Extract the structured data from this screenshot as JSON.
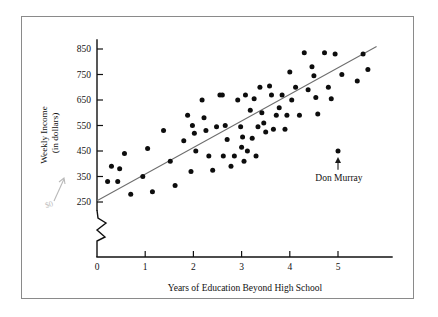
{
  "figure": {
    "background_color": "#ffffff",
    "frame_color": "#8a8a8a",
    "ink_color": "#111111",
    "regression_line_color": "#6e6e6e",
    "pencil_color": "#bdbdbd"
  },
  "chart_data": {
    "type": "scatter",
    "title": "",
    "xlabel": "Years of Education Beyond High School",
    "ylabel": "Weekly Income (in dollars)",
    "ylabel_line1": "Weekly Income",
    "ylabel_line2": "(in dollars)",
    "xlim": [
      0,
      5.85
    ],
    "ylim": [
      250,
      880
    ],
    "xticks": [
      0,
      1,
      2,
      3,
      4,
      5
    ],
    "xtick_labels": [
      "0",
      "1",
      "2",
      "3",
      "4",
      "5"
    ],
    "yticks": [
      250,
      350,
      450,
      550,
      650,
      750,
      850
    ],
    "ytick_labels": [
      "250",
      "350",
      "450",
      "550",
      "650",
      "750",
      "850"
    ],
    "grid": false,
    "legend": "none",
    "y_axis_break": true,
    "y_axis_break_note": "zigzag break between 0 and 250 on the vertical axis",
    "trend_line": {
      "label": "least-squares regression line",
      "x_start": 0.0,
      "y_start": 255,
      "x_end": 5.8,
      "y_end": 860,
      "slope": 104.3,
      "intercept": 255
    },
    "annotations": [
      {
        "text": "Don Murray",
        "points_to_x": 5.0,
        "points_to_y": 450,
        "label_x": 5.02,
        "label_y": 345,
        "arrow": "up"
      },
      {
        "text": "$0",
        "style": "handwritten-pencil",
        "points_to_x": -0.95,
        "points_to_y": 330,
        "arrow": "up"
      }
    ],
    "points": [
      {
        "x": 0.22,
        "y": 330
      },
      {
        "x": 0.3,
        "y": 390
      },
      {
        "x": 0.43,
        "y": 330
      },
      {
        "x": 0.47,
        "y": 380
      },
      {
        "x": 0.57,
        "y": 440
      },
      {
        "x": 0.7,
        "y": 280
      },
      {
        "x": 0.95,
        "y": 350
      },
      {
        "x": 1.05,
        "y": 460
      },
      {
        "x": 1.15,
        "y": 290
      },
      {
        "x": 1.38,
        "y": 530
      },
      {
        "x": 1.52,
        "y": 410
      },
      {
        "x": 1.62,
        "y": 315
      },
      {
        "x": 1.8,
        "y": 490
      },
      {
        "x": 1.88,
        "y": 590
      },
      {
        "x": 1.95,
        "y": 370
      },
      {
        "x": 1.98,
        "y": 550
      },
      {
        "x": 2.02,
        "y": 520
      },
      {
        "x": 2.05,
        "y": 450
      },
      {
        "x": 2.18,
        "y": 650
      },
      {
        "x": 2.22,
        "y": 580
      },
      {
        "x": 2.26,
        "y": 530
      },
      {
        "x": 2.32,
        "y": 430
      },
      {
        "x": 2.4,
        "y": 375
      },
      {
        "x": 2.48,
        "y": 545
      },
      {
        "x": 2.55,
        "y": 670
      },
      {
        "x": 2.6,
        "y": 670
      },
      {
        "x": 2.62,
        "y": 430
      },
      {
        "x": 2.66,
        "y": 550
      },
      {
        "x": 2.7,
        "y": 495
      },
      {
        "x": 2.78,
        "y": 390
      },
      {
        "x": 2.85,
        "y": 430
      },
      {
        "x": 2.92,
        "y": 650
      },
      {
        "x": 2.98,
        "y": 545
      },
      {
        "x": 3.0,
        "y": 465
      },
      {
        "x": 3.02,
        "y": 505
      },
      {
        "x": 3.05,
        "y": 410
      },
      {
        "x": 3.08,
        "y": 670
      },
      {
        "x": 3.12,
        "y": 450
      },
      {
        "x": 3.18,
        "y": 610
      },
      {
        "x": 3.22,
        "y": 500
      },
      {
        "x": 3.26,
        "y": 655
      },
      {
        "x": 3.3,
        "y": 430
      },
      {
        "x": 3.34,
        "y": 545
      },
      {
        "x": 3.38,
        "y": 700
      },
      {
        "x": 3.42,
        "y": 600
      },
      {
        "x": 3.46,
        "y": 560
      },
      {
        "x": 3.5,
        "y": 525
      },
      {
        "x": 3.58,
        "y": 705
      },
      {
        "x": 3.62,
        "y": 670
      },
      {
        "x": 3.66,
        "y": 535
      },
      {
        "x": 3.72,
        "y": 590
      },
      {
        "x": 3.78,
        "y": 620
      },
      {
        "x": 3.84,
        "y": 670
      },
      {
        "x": 3.9,
        "y": 535
      },
      {
        "x": 3.94,
        "y": 590
      },
      {
        "x": 4.0,
        "y": 760
      },
      {
        "x": 4.04,
        "y": 650
      },
      {
        "x": 4.12,
        "y": 700
      },
      {
        "x": 4.2,
        "y": 590
      },
      {
        "x": 4.3,
        "y": 835
      },
      {
        "x": 4.38,
        "y": 690
      },
      {
        "x": 4.46,
        "y": 780
      },
      {
        "x": 4.5,
        "y": 745
      },
      {
        "x": 4.54,
        "y": 660
      },
      {
        "x": 4.58,
        "y": 595
      },
      {
        "x": 5.0,
        "y": 450
      },
      {
        "x": 4.72,
        "y": 835
      },
      {
        "x": 4.8,
        "y": 700
      },
      {
        "x": 4.86,
        "y": 655
      },
      {
        "x": 4.94,
        "y": 830
      },
      {
        "x": 5.08,
        "y": 750
      },
      {
        "x": 5.4,
        "y": 725
      },
      {
        "x": 5.52,
        "y": 830
      },
      {
        "x": 5.62,
        "y": 770
      }
    ]
  }
}
